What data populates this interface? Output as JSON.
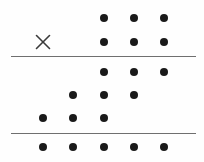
{
  "figure": {
    "width": 204,
    "height": 162,
    "background_color": "#fefefe",
    "dot_color": "#1a1a1a",
    "rule_color": "#6f6f6f",
    "mark_color": "#3a3a3a",
    "dot_diameter": 8,
    "rule_thickness": 1.4
  },
  "grid": {
    "column_x": [
      43,
      73,
      104,
      134,
      164
    ],
    "row_y": [
      18,
      42,
      72,
      95,
      118,
      147
    ],
    "column_spacing": 30,
    "column_count": 5,
    "row_count": 6
  },
  "chart_data": {
    "type": "scatter",
    "title": "",
    "xlabel": "",
    "ylabel": "",
    "grid": false,
    "legend": "none",
    "xlim": [
      0,
      204
    ],
    "ylim": [
      162,
      0
    ],
    "points": [
      {
        "name": "r1c3",
        "x": 104,
        "y": 18,
        "row": 1,
        "col": 3,
        "marker": "dot"
      },
      {
        "name": "r1c4",
        "x": 134,
        "y": 18,
        "row": 1,
        "col": 4,
        "marker": "dot"
      },
      {
        "name": "r1c5",
        "x": 164,
        "y": 18,
        "row": 1,
        "col": 5,
        "marker": "dot"
      },
      {
        "name": "r2c1",
        "x": 43,
        "y": 42,
        "row": 2,
        "col": 1,
        "marker": "cross"
      },
      {
        "name": "r2c3",
        "x": 104,
        "y": 42,
        "row": 2,
        "col": 3,
        "marker": "dot"
      },
      {
        "name": "r2c4",
        "x": 134,
        "y": 42,
        "row": 2,
        "col": 4,
        "marker": "dot"
      },
      {
        "name": "r2c5",
        "x": 164,
        "y": 42,
        "row": 2,
        "col": 5,
        "marker": "dot"
      },
      {
        "name": "r3c3",
        "x": 104,
        "y": 72,
        "row": 3,
        "col": 3,
        "marker": "dot"
      },
      {
        "name": "r3c4",
        "x": 134,
        "y": 72,
        "row": 3,
        "col": 4,
        "marker": "dot"
      },
      {
        "name": "r3c5",
        "x": 164,
        "y": 72,
        "row": 3,
        "col": 5,
        "marker": "dot"
      },
      {
        "name": "r4c2",
        "x": 73,
        "y": 95,
        "row": 4,
        "col": 2,
        "marker": "dot"
      },
      {
        "name": "r4c3",
        "x": 104,
        "y": 95,
        "row": 4,
        "col": 3,
        "marker": "dot"
      },
      {
        "name": "r4c4",
        "x": 134,
        "y": 95,
        "row": 4,
        "col": 4,
        "marker": "dot"
      },
      {
        "name": "r5c1",
        "x": 43,
        "y": 118,
        "row": 5,
        "col": 1,
        "marker": "dot"
      },
      {
        "name": "r5c2",
        "x": 73,
        "y": 118,
        "row": 5,
        "col": 2,
        "marker": "dot"
      },
      {
        "name": "r5c3",
        "x": 104,
        "y": 118,
        "row": 5,
        "col": 3,
        "marker": "dot"
      },
      {
        "name": "r6c1",
        "x": 43,
        "y": 147,
        "row": 6,
        "col": 1,
        "marker": "dot"
      },
      {
        "name": "r6c2",
        "x": 73,
        "y": 147,
        "row": 6,
        "col": 2,
        "marker": "dot"
      },
      {
        "name": "r6c3",
        "x": 104,
        "y": 147,
        "row": 6,
        "col": 3,
        "marker": "dot"
      },
      {
        "name": "r6c4",
        "x": 134,
        "y": 147,
        "row": 6,
        "col": 4,
        "marker": "dot"
      },
      {
        "name": "r6c5",
        "x": 164,
        "y": 147,
        "row": 6,
        "col": 5,
        "marker": "dot"
      }
    ],
    "rules": [
      {
        "name": "upper-rule",
        "y": 56,
        "x_start": 11,
        "x_end": 196
      },
      {
        "name": "lower-rule",
        "y": 133,
        "x_start": 11,
        "x_end": 196
      }
    ],
    "row_counts": [
      3,
      3,
      3,
      3,
      3,
      5
    ],
    "cross_markers": 1,
    "dot_markers": 20
  }
}
